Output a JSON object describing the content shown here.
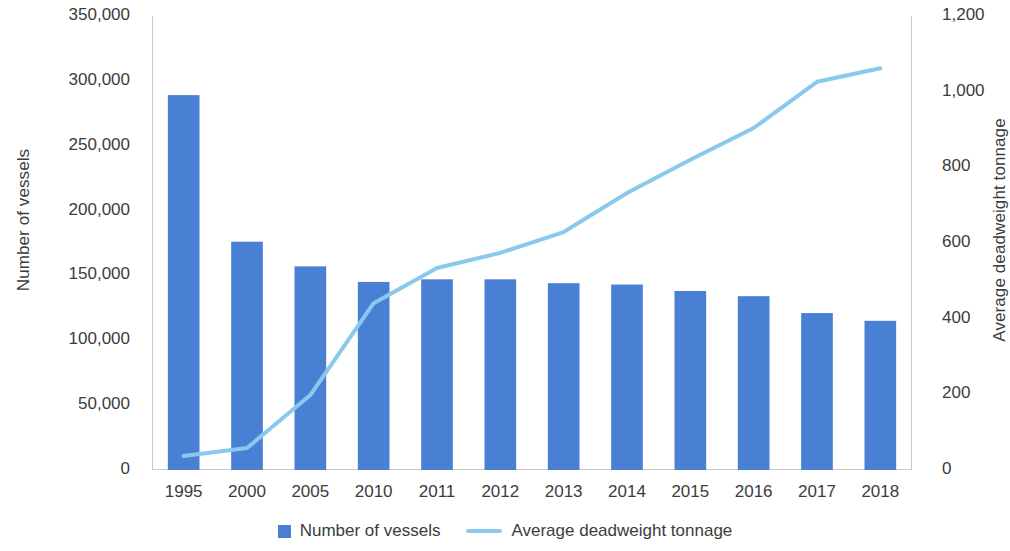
{
  "chart_data": {
    "type": "bar",
    "title": "",
    "xlabel": "",
    "ylabel": "Number of vessels",
    "y2label": "Average deadweight tonnage",
    "grid": false,
    "legend_position": "bottom-center",
    "categories": [
      "1995",
      "2000",
      "2005",
      "2010",
      "2011",
      "2012",
      "2013",
      "2014",
      "2015",
      "2016",
      "2017",
      "2018"
    ],
    "ylim": [
      0,
      350000
    ],
    "y_ticks": [
      0,
      50000,
      100000,
      150000,
      200000,
      250000,
      300000,
      350000
    ],
    "y_tick_labels": [
      "0",
      "50,000",
      "100,000",
      "150,000",
      "200,000",
      "250,000",
      "300,000",
      "350,000"
    ],
    "y2lim": [
      0,
      1200
    ],
    "y2_ticks": [
      0,
      200,
      400,
      600,
      800,
      1000,
      1200
    ],
    "y2_tick_labels": [
      "0",
      "200",
      "400",
      "600",
      "800",
      "1,000",
      "1,200"
    ],
    "series": [
      {
        "name": "Number of vessels",
        "type": "bar",
        "axis": "left",
        "color": "#4a80d4",
        "values": [
          289000,
          176000,
          157000,
          145000,
          147000,
          147000,
          144000,
          143000,
          138000,
          134000,
          121000,
          115000
        ]
      },
      {
        "name": "Average deadweight tonnage",
        "type": "line",
        "axis": "right",
        "color": "#8ac8ed",
        "values": [
          37,
          58,
          198,
          441,
          534,
          574,
          629,
          732,
          820,
          904,
          1026,
          1062
        ]
      }
    ]
  },
  "legend": {
    "items": [
      {
        "label": "Number of vessels",
        "marker": "square-swatch",
        "color": "#4a80d4"
      },
      {
        "label": "Average deadweight tonnage",
        "marker": "line-swatch",
        "color": "#8ac8ed"
      }
    ]
  },
  "axes": {
    "left_title": "Number of vessels",
    "right_title": "Average deadweight tonnage"
  }
}
